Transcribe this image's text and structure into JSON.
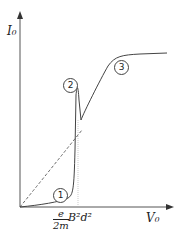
{
  "axes": {
    "y_label": "I₀",
    "x_label": "V₀",
    "x_tick_fraction_num": "e",
    "x_tick_fraction_den": "2m",
    "x_tick_rest": "B²d²"
  },
  "markers": [
    "1",
    "2",
    "3"
  ],
  "colors": {
    "line": "#444444",
    "dashed": "#555555"
  }
}
